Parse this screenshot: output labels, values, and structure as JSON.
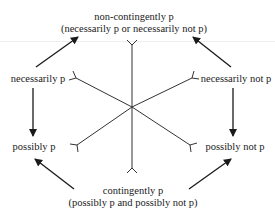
{
  "diagram": {
    "type": "modal-logic-hexagon",
    "labels": {
      "top_line1": "non-contingently p",
      "top_line2": "(necessarily p or necessarily not p)",
      "upper_left": "necessarily p",
      "upper_right": "necessarily not p",
      "lower_left": "possibly p",
      "lower_right": "possibly not p",
      "bottom_line1": "contingently p",
      "bottom_line2": "(possibly p and possibly not p)"
    },
    "arrows": [
      {
        "from": "necessarily p",
        "to": "non-contingently p"
      },
      {
        "from": "necessarily not p",
        "to": "non-contingently p"
      },
      {
        "from": "necessarily p",
        "to": "possibly p"
      },
      {
        "from": "necessarily not p",
        "to": "possibly not p"
      },
      {
        "from": "contingently p",
        "to": "possibly p"
      },
      {
        "from": "contingently p",
        "to": "possibly not p"
      }
    ],
    "center_spokes": 6,
    "spoke_end_marker": "fork",
    "colors": {
      "line": "#2a2a2a",
      "background": "#ffffff"
    }
  }
}
